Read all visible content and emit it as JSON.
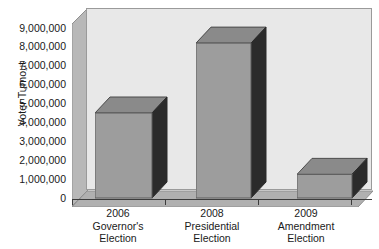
{
  "chart_data": {
    "type": "bar",
    "title": "",
    "xlabel": "",
    "ylabel": "Voter Turnout",
    "categories": [
      "2006 Governor's Election",
      "2008 Presidential Election",
      "2009 Amendment Election"
    ],
    "category_lines": [
      [
        "2006",
        "Governor's",
        "Election"
      ],
      [
        "2008",
        "Presidential",
        "Election"
      ],
      [
        "2009",
        "Amendment",
        "Election"
      ]
    ],
    "values": [
      4500000,
      8200000,
      1250000
    ],
    "ylim": [
      0,
      9000000
    ],
    "ytick_values": [
      0,
      1000000,
      2000000,
      3000000,
      4000000,
      5000000,
      6000000,
      7000000,
      8000000,
      9000000
    ],
    "ytick_labels": [
      "0",
      "1,000,000",
      "2,000,000",
      "3,000,000",
      "4,000,000",
      "5,000,000",
      "6,000,000",
      "7,000,000",
      "8,000,000",
      "9,000,000"
    ],
    "grid": false,
    "legend": null,
    "style": "3d-bar",
    "colors": {
      "bar_front": "#9d9d9d",
      "bar_side": "#2b2b2b",
      "bar_top": "#8a8a8a",
      "plot_background": "#e8e8e8",
      "wall_side": "#b8b8b8",
      "floor": "#b0b0b0",
      "axis": "#3c3c3c",
      "text": "#1a1a1a"
    }
  },
  "axis": {
    "y_title": "Voter Turnout"
  }
}
